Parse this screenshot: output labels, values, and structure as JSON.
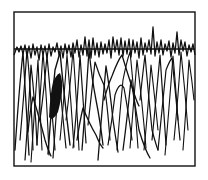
{
  "illustration": {
    "description": "Line-art trace illustration: dense oscillating scribble strokes crossing a horizontal baseline inside a rectangular frame",
    "width": 208,
    "height": 180,
    "background": "#ffffff",
    "ink_color": "#111111",
    "frame": {
      "x": 14,
      "y": 12,
      "width": 181,
      "height": 154,
      "stroke_width": 1.4
    },
    "baseline": {
      "x1": 14,
      "x2": 195,
      "y": 49,
      "stroke_width": 1.6
    },
    "top_wave": "M14,55 L17,47 L19,52 L21,46 L23,54 L25,45 L27,56 L29,46 L31,58 L33,44 L35,55 L37,47 L39,60 L41,45 L43,55 L45,46 L47,58 L49,44 L51,56 L53,47 L55,52 L57,43 L59,55 L61,46 L63,58 L65,44 L67,54 L69,45 L71,57 L73,43 L75,53 L77,40 L79,57 L81,45 L83,55 L85,37 L87,56 L89,40 L91,58 L93,38 L95,55 L97,43 L99,57 L101,42 L103,54 L105,44 L107,53 L109,40 L111,58 L113,37 L115,52 L117,40 L119,55 L121,38 L123,56 L125,41 L127,54 L129,39 L131,57 L133,40 L135,53 L137,42 L139,58 L141,38 L143,55 L145,43 L147,52 L149,40 L151,54 L153,27 L155,56 L157,42 L159,53 L161,40 L163,55 L165,44 L167,51 L169,41 L171,57 L173,43 L175,53 L177,32 L179,55 L181,40 L183,51 L185,42 L187,56 L189,45 L191,52 L193,44 L195,55",
    "strokes": [
      {
        "d": "M15,150 Q19,90 23,52 Q26,100 29,155",
        "w": 1.3
      },
      {
        "d": "M20,140 Q24,95 27,50 Q31,90 33,150",
        "w": 1.2
      },
      {
        "d": "M25,160 Q28,120 31,65 Q35,100 37,145",
        "w": 1.2
      },
      {
        "d": "M28,132 Q30,110 33,97 Q40,120 45,140 Q48,150 51,156",
        "w": 1.3
      },
      {
        "d": "M31,162 Q34,120 38,60 Q40,110 42,150",
        "w": 1.1
      },
      {
        "d": "M37,145 Q40,100 43,52 Q47,100 49,155",
        "w": 1.1
      },
      {
        "d": "M40,120 Q44,90 47,56 Q52,110 55,150",
        "w": 1.2
      },
      {
        "d": "M48,154 Q52,100 55,70 Q58,60 60,52 Q64,95 70,145",
        "w": 1.4
      },
      {
        "d": "M53,158 Q56,120 59,75 Q62,110 66,148",
        "w": 1.2
      },
      {
        "d": "M60,140 Q64,100 67,55 Q71,100 74,147",
        "w": 1.1
      },
      {
        "d": "M66,120 Q70,90 73,50 Q76,90 79,150",
        "w": 1.1
      },
      {
        "d": "M73,148 Q77,110 80,55 Q83,100 86,143",
        "w": 1.2
      },
      {
        "d": "M77,140 Q80,120 83,108 Q90,125 96,135 Q100,145 103,148",
        "w": 1.3
      },
      {
        "d": "M82,150 Q86,100 89,50 Q92,80 96,100 Q100,120 103,145",
        "w": 1.3
      },
      {
        "d": "M88,125 Q92,90 95,62 Q99,75 104,85 Q107,100 110,140",
        "w": 1.2
      },
      {
        "d": "M98,160 Q102,110 106,66 Q110,90 113,120 Q116,140 118,152",
        "w": 1.3
      },
      {
        "d": "M104,100 Q108,85 112,76 Q118,60 122,55 Q128,75 133,90 Q136,100 139,106",
        "w": 1.3
      },
      {
        "d": "M108,145 Q112,120 115,95 Q120,80 124,88 Q128,110 132,140",
        "w": 1.2
      },
      {
        "d": "M117,150 Q120,110 123,80 Q127,60 130,52 Q134,90 138,148",
        "w": 1.1
      },
      {
        "d": "M123,150 Q127,120 131,80 Q136,110 139,130 Q145,150 150,158",
        "w": 1.3
      },
      {
        "d": "M130,148 Q134,100 137,60 Q142,100 146,148",
        "w": 1.1
      },
      {
        "d": "M140,100 Q142,80 145,55 Q148,90 152,130 Q156,145 158,150",
        "w": 1.2
      },
      {
        "d": "M144,150 Q148,110 151,65 Q155,100 158,130",
        "w": 1.1
      },
      {
        "d": "M152,140 Q156,100 160,55 Q163,100 166,145",
        "w": 1.2
      },
      {
        "d": "M158,150 Q162,110 166,70 Q170,60 172,58 Q176,100 180,140",
        "w": 1.2
      },
      {
        "d": "M165,155 Q169,110 173,56 Q176,90 178,120",
        "w": 1.1
      },
      {
        "d": "M174,140 Q178,100 181,52 Q185,90 188,130",
        "w": 1.1
      },
      {
        "d": "M183,150 Q186,110 189,60 Q192,80 194,100",
        "w": 1.1
      }
    ],
    "filled_blob": "M49,117 Q50,95 53,82 Q56,75 60,73 Q63,80 62,92 Q60,105 58,112 Q55,118 51,119 Z"
  }
}
